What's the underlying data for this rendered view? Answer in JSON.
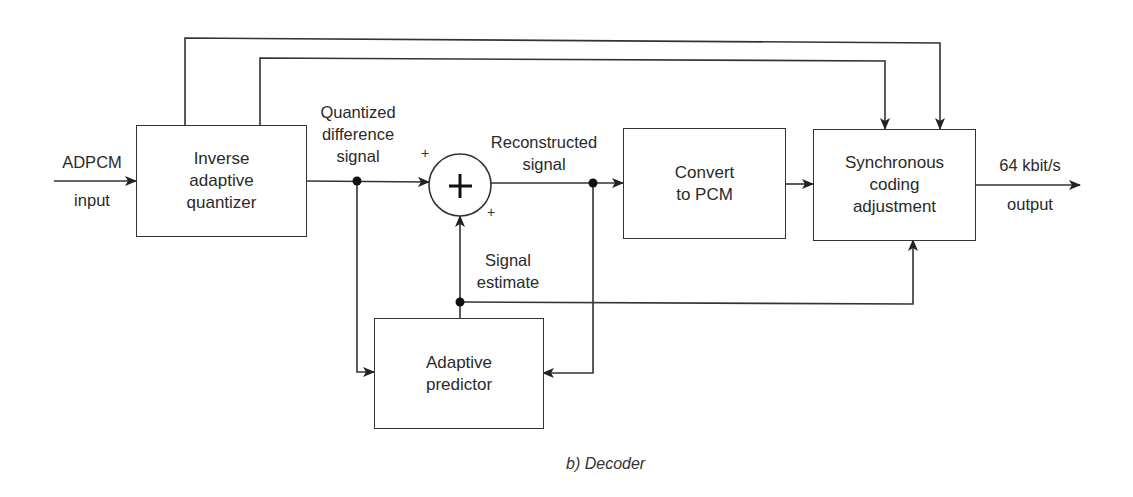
{
  "diagram": {
    "caption": "b) Decoder",
    "blocks": {
      "inverse_quantizer": "Inverse\nadaptive\nquantizer",
      "convert_pcm": "Convert\nto PCM",
      "sync_coding": "Synchronous\ncoding\nadjustment",
      "adaptive_predictor": "Adaptive\npredictor"
    },
    "summer": {
      "symbol": "+",
      "input_signs": [
        "+",
        "+"
      ]
    },
    "signals": {
      "input_top": "ADPCM",
      "input_bottom": "input",
      "quantized_difference": "Quantized\ndifference\nsignal",
      "reconstructed": "Reconstructed\nsignal",
      "signal_estimate": "Signal\nestimate",
      "output_top": "64 kbit/s",
      "output_bottom": "output"
    },
    "colors": {
      "line": "#333333",
      "background": "#ffffff"
    }
  }
}
